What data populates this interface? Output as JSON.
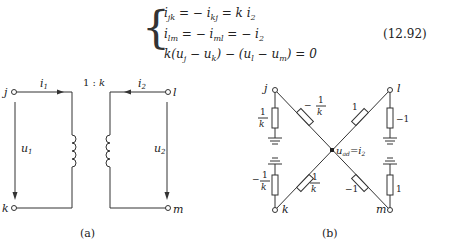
{
  "equations": {
    "line1": "i_jk = −i_kj = k i_2",
    "line2": "i_lm = −i_ml = −i_2",
    "line3": "k(u_j − u_k) − (u_l − u_m) = 0",
    "number": "(12.92)"
  },
  "figure_a": {
    "caption": "(a)",
    "ratio": "1 : k",
    "nodes": [
      "j",
      "k",
      "l",
      "m"
    ],
    "currents": [
      "i1",
      "i2"
    ],
    "voltages": [
      "u1",
      "u2"
    ]
  },
  "figure_b": {
    "caption": "(b)",
    "nodes": [
      "j",
      "k",
      "l",
      "m"
    ],
    "center_label": "u_ad = i_2",
    "resistors": {
      "j_ground": "1/k",
      "j_center": "−1/k",
      "l_center": "1",
      "l_ground": "−1",
      "k_ground": "−1/k",
      "k_center": "1/k",
      "m_center": "−1",
      "m_ground": "1"
    }
  }
}
